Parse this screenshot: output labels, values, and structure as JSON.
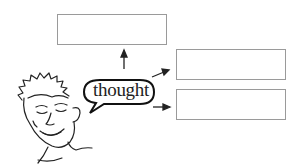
{
  "diagram": {
    "bubble_label": "thought",
    "boxes": [
      {
        "id": "top",
        "text": ""
      },
      {
        "id": "right-upper",
        "text": ""
      },
      {
        "id": "right-lower",
        "text": ""
      }
    ],
    "colors": {
      "line": "#222222",
      "box_border": "#9a9a9a",
      "background": "#ffffff"
    }
  }
}
